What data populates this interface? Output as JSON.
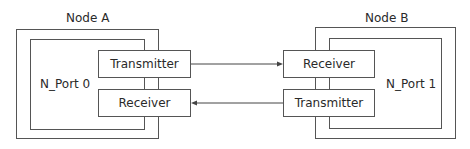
{
  "node_a": {
    "title": "Node A",
    "port": "N_Port 0",
    "transmitter": "Transmitter",
    "receiver": "Receiver"
  },
  "node_b": {
    "title": "Node B",
    "port": "N_Port 1",
    "receiver": "Receiver",
    "transmitter": "Transmitter"
  },
  "links": [
    {
      "from": "Node A Transmitter",
      "to": "Node B Receiver"
    },
    {
      "from": "Node B Transmitter",
      "to": "Node A Receiver"
    }
  ]
}
